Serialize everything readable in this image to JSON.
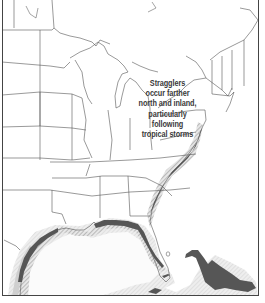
{
  "map": {
    "region": "Eastern United States and Gulf of Mexico",
    "annotation": {
      "lines": [
        "Stragglers",
        "occur farther",
        "north and inland,",
        "particularly",
        "following",
        "tropical storms"
      ]
    },
    "legend_colors": {
      "core_range": "#555555",
      "hatched_range": "#9a9a9a",
      "light_range": "#d6d6d6",
      "land": "#ffffff",
      "border": "#444444"
    }
  }
}
